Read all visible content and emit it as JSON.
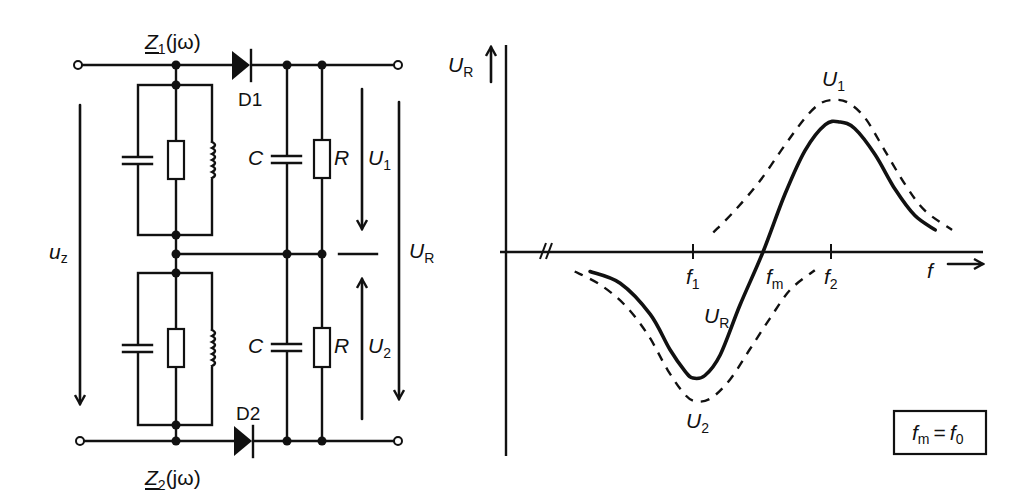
{
  "circuit": {
    "z1_label": {
      "main": "Z",
      "sub": "1",
      "suffix": "(jω)"
    },
    "z2_label": {
      "main": "Z",
      "sub": "2",
      "suffix": "(jω)"
    },
    "diode_top": "D1",
    "diode_bottom": "D2",
    "capacitor_top": "C",
    "resistor_top": "R",
    "capacitor_bottom": "C",
    "resistor_bottom": "R",
    "u1": {
      "main": "U",
      "sub": "1"
    },
    "u2": {
      "main": "U",
      "sub": "2"
    },
    "ur": {
      "main": "U",
      "sub": "R"
    },
    "uz": {
      "main": "u",
      "sub": "z"
    }
  },
  "graph": {
    "y_axis_label": {
      "main": "U",
      "sub": "R"
    },
    "x_axis_label": "f",
    "ticks": [
      {
        "main": "f",
        "sub": "1"
      },
      {
        "main": "f",
        "sub": "m"
      },
      {
        "main": "f",
        "sub": "2"
      }
    ],
    "curve_labels": {
      "u1": {
        "main": "U",
        "sub": "1"
      },
      "ur": {
        "main": "U",
        "sub": "R"
      },
      "u2": {
        "main": "U",
        "sub": "2"
      }
    },
    "note": {
      "lhs_main": "f",
      "lhs_sub": "m",
      "eq": "=",
      "rhs_main": "f",
      "rhs_sub": "0"
    }
  },
  "chart_data": {
    "type": "line",
    "title": "",
    "xlabel": "f",
    "ylabel": "U_R",
    "x_ticks": [
      "f1",
      "fm",
      "f2"
    ],
    "x_tick_positions": [
      -1,
      0,
      1
    ],
    "axis_break": true,
    "note": "fm = f0",
    "grid": false,
    "series": [
      {
        "name": "U_R",
        "style": "solid",
        "x": [
          -2.47,
          -2.04,
          -1.61,
          -1.33,
          -1.11,
          -1.0,
          -0.83,
          -0.61,
          -0.33,
          0,
          0.31,
          0.6,
          0.89,
          1.1,
          1.31,
          1.6,
          1.89,
          2.17,
          2.46
        ],
        "y": [
          -0.15,
          -0.24,
          -0.48,
          -0.75,
          -0.92,
          -0.97,
          -0.95,
          -0.79,
          -0.41,
          0,
          0.44,
          0.78,
          0.98,
          1.0,
          0.95,
          0.75,
          0.48,
          0.28,
          0.17
        ]
      },
      {
        "name": "U_1",
        "style": "dashed",
        "x": [
          -0.71,
          -0.4,
          -0.04,
          0.31,
          0.6,
          0.81,
          1.0,
          1.21,
          1.46,
          1.74,
          2.03,
          2.31,
          2.7
        ],
        "y": [
          0.15,
          0.32,
          0.55,
          0.82,
          1.03,
          1.14,
          1.17,
          1.15,
          1.03,
          0.78,
          0.52,
          0.32,
          0.17
        ]
      },
      {
        "name": "U_2",
        "style": "dashed",
        "x": [
          -2.69,
          -2.33,
          -1.97,
          -1.64,
          -1.36,
          -1.11,
          -0.94,
          -0.73,
          -0.47,
          -0.19,
          0.1,
          0.39,
          0.74
        ],
        "y": [
          -0.15,
          -0.25,
          -0.41,
          -0.64,
          -0.91,
          -1.1,
          -1.15,
          -1.12,
          -0.98,
          -0.75,
          -0.51,
          -0.29,
          -0.14
        ]
      }
    ]
  }
}
